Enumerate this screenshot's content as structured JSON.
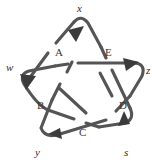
{
  "figure": {
    "type": "pentagram-knot-diagram",
    "background_color": "#ffffff",
    "stroke_color": "#545454",
    "label_color": "#2b2b2b",
    "width": 162,
    "height": 166
  },
  "vertex_labels": [
    {
      "id": "x",
      "text": "x",
      "position": "top",
      "x": 77,
      "y": 3
    },
    {
      "id": "w",
      "text": "w",
      "position": "left",
      "x": 6,
      "y": 62
    },
    {
      "id": "z",
      "text": "z",
      "position": "right",
      "x": 146,
      "y": 65
    },
    {
      "id": "y",
      "text": "y",
      "position": "bottom-left",
      "x": 35,
      "y": 147
    },
    {
      "id": "s",
      "text": "s",
      "position": "bottom-right",
      "x": 124,
      "y": 147
    }
  ],
  "region_labels": [
    {
      "id": "A",
      "text": "A",
      "position": "upper-left",
      "x": 55,
      "y": 47
    },
    {
      "id": "E",
      "text": "E",
      "position": "upper-right",
      "x": 105,
      "y": 47
    },
    {
      "id": "B",
      "text": "B",
      "position": "lower-left",
      "x": 37,
      "y": 100
    },
    {
      "id": "D",
      "text": "D",
      "position": "lower-right",
      "x": 119,
      "y": 100
    },
    {
      "id": "C",
      "text": "C",
      "position": "bottom",
      "x": 79,
      "y": 127
    }
  ],
  "arrowheads": [
    {
      "id": "arrow-x",
      "at_vertex": "x",
      "direction": "up-left"
    },
    {
      "id": "arrow-w",
      "at_vertex": "w",
      "direction": "down-left"
    },
    {
      "id": "arrow-z",
      "at_vertex": "z",
      "direction": "right"
    },
    {
      "id": "arrow-y",
      "at_vertex": "y",
      "direction": "right"
    },
    {
      "id": "arrow-s",
      "at_vertex": "s",
      "direction": "up"
    }
  ]
}
